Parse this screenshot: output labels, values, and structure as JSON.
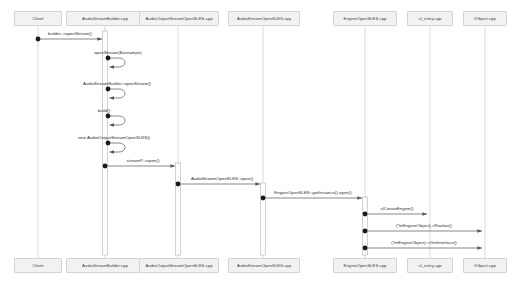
{
  "diagram": {
    "type": "uml-sequence-diagram",
    "colors": {
      "participant_fill": "#f2f2f2",
      "participant_border": "#d4d4d4",
      "lifeline": "#c9c9c9",
      "activation_fill": "#fdfdfd",
      "activation_border": "#b4b4b4",
      "message_line": "#555555",
      "endpoint": "#1a1a1a",
      "text": "#2b2b2b",
      "background": "#ffffff"
    },
    "participants": [
      {
        "id": "client",
        "label": "Client",
        "x": 38,
        "box_left": 14,
        "box_width": 48
      },
      {
        "id": "builder",
        "label": "AudioStreamBuilder.cpp",
        "x": 105,
        "box_left": 66,
        "box_width": 78
      },
      {
        "id": "outstream",
        "label": "AudioOutputStreamOpenSLES.cpp",
        "x": 178,
        "box_left": 139,
        "box_width": 80
      },
      {
        "id": "stream",
        "label": "AudioStreamOpenSLES.cpp",
        "x": 263,
        "box_left": 228,
        "box_width": 72
      },
      {
        "id": "engine",
        "label": "EngineOpenSLES.cpp",
        "x": 365,
        "box_left": 333,
        "box_width": 64
      },
      {
        "id": "slentry",
        "label": "sl_entry.cpp",
        "x": 430,
        "box_left": 407,
        "box_width": 46
      },
      {
        "id": "iobject",
        "label": "IObject.cpp",
        "x": 485,
        "box_left": 463,
        "box_width": 44
      }
    ],
    "header_y": 11,
    "footer_y": 258,
    "lifeline_top": 26,
    "lifeline_bottom": 258,
    "activations": [
      {
        "id": "act-builder",
        "participant": "builder",
        "x": 105,
        "top": 31,
        "bottom": 255,
        "width": 5
      },
      {
        "id": "act-outstream",
        "participant": "outstream",
        "x": 178,
        "top": 163,
        "bottom": 255,
        "width": 5
      },
      {
        "id": "act-stream",
        "participant": "stream",
        "x": 263,
        "top": 183,
        "bottom": 255,
        "width": 5
      },
      {
        "id": "act-engine",
        "participant": "engine",
        "x": 365,
        "top": 197,
        "bottom": 255,
        "width": 5
      }
    ],
    "messages": [
      {
        "id": "m1",
        "label": "builder->openStream()",
        "from": "client",
        "to": "builder",
        "from_x": 38,
        "to_x": 102,
        "y": 39,
        "label_x": 70,
        "label_y": 31,
        "kind": "call"
      },
      {
        "id": "m2",
        "label": "openStream($streamptr)",
        "from": "builder",
        "to": "builder",
        "from_x": 108,
        "to_x": 108,
        "y": 58,
        "label_x": 118,
        "label_y": 50,
        "kind": "self"
      },
      {
        "id": "m3",
        "label": "AudioStreamBuilder::openStream()",
        "from": "builder",
        "to": "builder",
        "from_x": 108,
        "to_x": 108,
        "y": 89,
        "label_x": 117,
        "label_y": 81,
        "kind": "self"
      },
      {
        "id": "m4",
        "label": "build()",
        "from": "builder",
        "to": "builder",
        "from_x": 108,
        "to_x": 108,
        "y": 116,
        "label_x": 104,
        "label_y": 108,
        "kind": "self"
      },
      {
        "id": "m5",
        "label": "new AudioOutputStreamOpenSLES()",
        "from": "builder",
        "to": "builder",
        "from_x": 108,
        "to_x": 108,
        "y": 143,
        "label_x": 114,
        "label_y": 135,
        "kind": "self"
      },
      {
        "id": "m6",
        "label": "streamP->open()",
        "from": "builder",
        "to": "outstream",
        "from_x": 105,
        "to_x": 175,
        "y": 166,
        "label_x": 143,
        "label_y": 158,
        "kind": "call"
      },
      {
        "id": "m7",
        "label": "AudioStreamOpenSLES::open()",
        "from": "outstream",
        "to": "stream",
        "from_x": 178,
        "to_x": 260,
        "y": 184,
        "label_x": 222,
        "label_y": 176,
        "kind": "call"
      },
      {
        "id": "m8",
        "label": "EngineOpenSLES::getInstance().open()",
        "from": "stream",
        "to": "engine",
        "from_x": 263,
        "to_x": 362,
        "y": 198,
        "label_x": 313,
        "label_y": 190,
        "kind": "call"
      },
      {
        "id": "m9",
        "label": "slCreateEngine()",
        "from": "engine",
        "to": "slentry",
        "from_x": 365,
        "to_x": 427,
        "y": 214,
        "label_x": 397,
        "label_y": 206,
        "kind": "call"
      },
      {
        "id": "m10",
        "label": "(*mEngineObject)->Realize()",
        "from": "engine",
        "to": "iobject",
        "from_x": 365,
        "to_x": 482,
        "y": 231,
        "label_x": 424,
        "label_y": 223,
        "kind": "call"
      },
      {
        "id": "m11",
        "label": "(*mEngineObject)->GetInterface()",
        "from": "engine",
        "to": "iobject",
        "from_x": 365,
        "to_x": 482,
        "y": 248,
        "label_x": 424,
        "label_y": 240,
        "kind": "call"
      }
    ]
  }
}
